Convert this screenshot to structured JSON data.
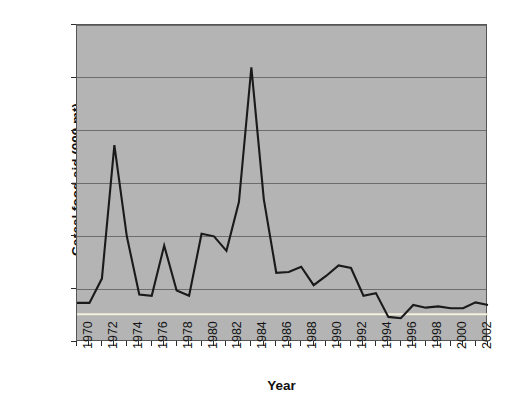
{
  "chart_data": {
    "type": "line",
    "title": "",
    "xlabel": "Year",
    "ylabel": "Cereal food aid (000 mt)",
    "xlim": [
      1970,
      2003
    ],
    "ylim": [
      0,
      1200
    ],
    "grid": true,
    "legend": "none",
    "background": "#b4b4b4",
    "x": [
      1970,
      1971,
      1972,
      1973,
      1974,
      1975,
      1976,
      1977,
      1978,
      1979,
      1980,
      1981,
      1982,
      1983,
      1984,
      1985,
      1986,
      1987,
      1988,
      1989,
      1990,
      1991,
      1992,
      1993,
      1994,
      1995,
      1996,
      1997,
      1998,
      1999,
      2000,
      2001,
      2002,
      2003
    ],
    "series": [
      {
        "name": "Cereal food aid",
        "color": "#1a1a1a",
        "values": [
          148,
          148,
          240,
          745,
          400,
          180,
          175,
          365,
          195,
          175,
          410,
          400,
          345,
          530,
          1040,
          540,
          262,
          265,
          285,
          215,
          250,
          290,
          280,
          175,
          185,
          95,
          90,
          140,
          130,
          135,
          128,
          128,
          150,
          140
        ]
      },
      {
        "name": "Reference baseline",
        "color": "#f2f0dc",
        "values": [
          105,
          105,
          105,
          105,
          105,
          105,
          105,
          105,
          105,
          105,
          105,
          105,
          105,
          105,
          105,
          105,
          105,
          105,
          105,
          105,
          105,
          105,
          105,
          105,
          105,
          105,
          105,
          105,
          105,
          105,
          105,
          105,
          105,
          105
        ]
      }
    ],
    "y_ticks": [
      0,
      200,
      400,
      600,
      800,
      1000,
      1200
    ],
    "y_tick_labels": [
      "0",
      "200",
      "400",
      "600",
      "800",
      "1,000",
      "1,200"
    ],
    "x_tick_values": [
      1970,
      1971,
      1972,
      1973,
      1974,
      1975,
      1976,
      1977,
      1978,
      1979,
      1980,
      1981,
      1982,
      1983,
      1984,
      1985,
      1986,
      1987,
      1988,
      1989,
      1990,
      1991,
      1992,
      1993,
      1994,
      1995,
      1996,
      1997,
      1998,
      1999,
      2000,
      2001,
      2002,
      2003
    ],
    "x_tick_labels": [
      "1970",
      "1972",
      "1974",
      "1976",
      "1978",
      "1980",
      "1982",
      "1984",
      "1986",
      "1988",
      "1990",
      "1992",
      "1994",
      "1996",
      "1998",
      "2000",
      "2002"
    ],
    "x_tick_label_values": [
      1970,
      1972,
      1974,
      1976,
      1978,
      1980,
      1982,
      1984,
      1986,
      1988,
      1990,
      1992,
      1994,
      1996,
      1998,
      2000,
      2002
    ]
  }
}
